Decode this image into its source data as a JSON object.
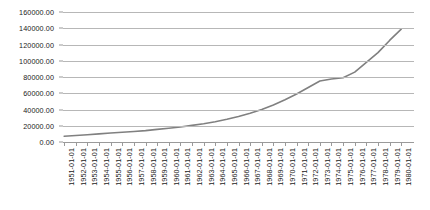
{
  "chart_data": {
    "type": "line",
    "title": "",
    "xlabel": "",
    "ylabel": "",
    "grid": true,
    "legend": false,
    "ylim": [
      0,
      160000
    ],
    "ytick_step": 20000,
    "ytick_labels": [
      "0.00",
      "20000.00",
      "40000.00",
      "60000.00",
      "80000.00",
      "100000.00",
      "120000.00",
      "140000.00",
      "160000.00"
    ],
    "ytick_values": [
      0,
      20000,
      40000,
      60000,
      80000,
      100000,
      120000,
      140000,
      160000
    ],
    "categories": [
      "1951-01-01",
      "1952-01-01",
      "1953-01-01",
      "1954-01-01",
      "1955-01-01",
      "1956-01-01",
      "1957-01-01",
      "1958-01-01",
      "1959-01-01",
      "1960-01-01",
      "1961-01-01",
      "1962-01-01",
      "1963-01-01",
      "1964-01-01",
      "1965-01-01",
      "1966-01-01",
      "1967-01-01",
      "1968-01-01",
      "1969-01-01",
      "1970-01-01",
      "1971-01-01",
      "1972-01-01",
      "1973-01-01",
      "1974-01-01",
      "1975-01-01",
      "1976-01-01",
      "1977-01-01",
      "1978-01-01",
      "1979-01-01",
      "1980-01-01"
    ],
    "values": [
      7000,
      8000,
      9000,
      10000,
      11000,
      12000,
      13000,
      14000,
      15500,
      17000,
      18500,
      20500,
      22500,
      25000,
      28000,
      31500,
      35500,
      40000,
      45500,
      52000,
      59000,
      67000,
      75000,
      77500,
      79000,
      86000,
      98000,
      110000,
      125000,
      139000
    ],
    "line_color": "#808080",
    "gridline_color": "#b7b7b7",
    "axis_color": "#9a9a9a",
    "background_color": "#ffffff"
  }
}
